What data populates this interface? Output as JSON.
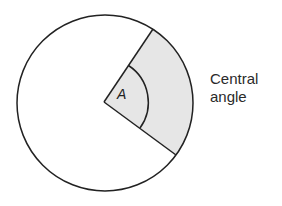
{
  "diagram": {
    "angle_label": "A",
    "caption_line1": "Central",
    "caption_line2": "angle",
    "colors": {
      "stroke": "#222222",
      "sector_fill": "#e6e6e6",
      "background": "#ffffff"
    },
    "geometry": {
      "center": [
        104,
        102
      ],
      "radius": 88,
      "inner_arc_radius": 44,
      "spoke_end_upper": [
        153,
        29
      ],
      "spoke_end_lower": [
        176,
        155
      ]
    }
  }
}
